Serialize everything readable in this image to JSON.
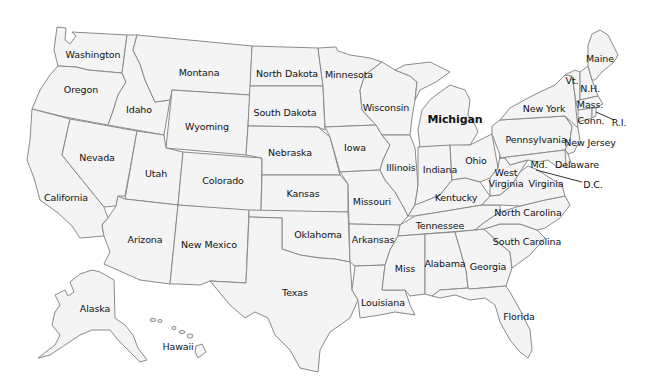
{
  "map": {
    "title": "United States",
    "background": "#ffffff",
    "state_fill": "#f4f4f4",
    "border_color": "#8a8a8a",
    "labels": [
      {
        "id": "washington",
        "text": "Washington",
        "x": 93,
        "y": 54
      },
      {
        "id": "oregon",
        "text": "Oregon",
        "x": 81,
        "y": 89
      },
      {
        "id": "california",
        "text": "California",
        "x": 66,
        "y": 197
      },
      {
        "id": "nevada",
        "text": "Nevada",
        "x": 97,
        "y": 157
      },
      {
        "id": "idaho",
        "text": "Idaho",
        "x": 139,
        "y": 109
      },
      {
        "id": "montana",
        "text": "Montana",
        "x": 199,
        "y": 72
      },
      {
        "id": "wyoming",
        "text": "Wyoming",
        "x": 207,
        "y": 126
      },
      {
        "id": "utah",
        "text": "Utah",
        "x": 156,
        "y": 173
      },
      {
        "id": "colorado",
        "text": "Colorado",
        "x": 223,
        "y": 180
      },
      {
        "id": "arizona",
        "text": "Arizona",
        "x": 145,
        "y": 239
      },
      {
        "id": "new-mexico",
        "text": "New Mexico",
        "x": 209,
        "y": 244
      },
      {
        "id": "north-dakota",
        "text": "North Dakota",
        "x": 287,
        "y": 73
      },
      {
        "id": "south-dakota",
        "text": "South Dakota",
        "x": 285,
        "y": 112
      },
      {
        "id": "nebraska",
        "text": "Nebraska",
        "x": 290,
        "y": 152
      },
      {
        "id": "kansas",
        "text": "Kansas",
        "x": 303,
        "y": 193
      },
      {
        "id": "oklahoma",
        "text": "Oklahoma",
        "x": 318,
        "y": 234
      },
      {
        "id": "texas",
        "text": "Texas",
        "x": 295,
        "y": 292
      },
      {
        "id": "minnesota",
        "text": "Minnesota",
        "x": 349,
        "y": 74
      },
      {
        "id": "iowa",
        "text": "Iowa",
        "x": 355,
        "y": 147
      },
      {
        "id": "missouri",
        "text": "Missouri",
        "x": 372,
        "y": 201
      },
      {
        "id": "arkansas",
        "text": "Arkansas",
        "x": 373,
        "y": 239
      },
      {
        "id": "louisiana",
        "text": "Louisiana",
        "x": 383,
        "y": 302
      },
      {
        "id": "wisconsin",
        "text": "Wisconsin",
        "x": 386,
        "y": 107
      },
      {
        "id": "illinois",
        "text": "Illinois",
        "x": 401,
        "y": 167
      },
      {
        "id": "michigan",
        "text": "Michigan",
        "x": 455,
        "y": 119,
        "big": true
      },
      {
        "id": "indiana",
        "text": "Indiana",
        "x": 440,
        "y": 169
      },
      {
        "id": "ohio",
        "text": "Ohio",
        "x": 476,
        "y": 160
      },
      {
        "id": "kentucky",
        "text": "Kentucky",
        "x": 456,
        "y": 197
      },
      {
        "id": "tennessee",
        "text": "Tennessee",
        "x": 440,
        "y": 225
      },
      {
        "id": "mississippi",
        "text": "Miss",
        "x": 405,
        "y": 268
      },
      {
        "id": "alabama",
        "text": "Alabama",
        "x": 445,
        "y": 263
      },
      {
        "id": "georgia",
        "text": "Georgia",
        "x": 488,
        "y": 266
      },
      {
        "id": "florida",
        "text": "Florida",
        "x": 519,
        "y": 316
      },
      {
        "id": "south-carolina",
        "text": "South Carolina",
        "x": 527,
        "y": 241
      },
      {
        "id": "north-carolina",
        "text": "North Carolina",
        "x": 528,
        "y": 212
      },
      {
        "id": "west-virginia",
        "text": "West\nVirginia",
        "x": 506,
        "y": 178
      },
      {
        "id": "virginia",
        "text": "Virginia",
        "x": 546,
        "y": 183
      },
      {
        "id": "pennsylvania",
        "text": "Pennsylvania",
        "x": 536,
        "y": 139
      },
      {
        "id": "new-york",
        "text": "New York",
        "x": 544,
        "y": 108
      },
      {
        "id": "maryland",
        "text": "Md.",
        "x": 539,
        "y": 164
      },
      {
        "id": "delaware",
        "text": "Delaware",
        "x": 577,
        "y": 164
      },
      {
        "id": "new-jersey",
        "text": "New Jersey",
        "x": 590,
        "y": 142
      },
      {
        "id": "dc",
        "text": "D.C.",
        "x": 593,
        "y": 184
      },
      {
        "id": "connecticut",
        "text": "Conn.",
        "x": 591,
        "y": 120
      },
      {
        "id": "rhode-island",
        "text": "R.I.",
        "x": 619,
        "y": 122
      },
      {
        "id": "massachusetts",
        "text": "Mass.",
        "x": 590,
        "y": 104
      },
      {
        "id": "vermont",
        "text": "Vt.",
        "x": 572,
        "y": 80
      },
      {
        "id": "new-hampshire",
        "text": "N.H.",
        "x": 590,
        "y": 88
      },
      {
        "id": "maine",
        "text": "Maine",
        "x": 600,
        "y": 58
      },
      {
        "id": "alaska",
        "text": "Alaska",
        "x": 95,
        "y": 308
      },
      {
        "id": "hawaii",
        "text": "Hawaii",
        "x": 178,
        "y": 346
      }
    ]
  }
}
